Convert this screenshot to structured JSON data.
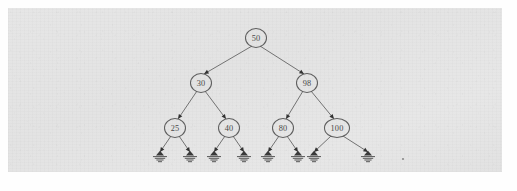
{
  "figure": {
    "background_color": "#e4e4e4",
    "page_color": "#fefefe",
    "node_stroke_color": "#5e5e5e",
    "edge_color": "#6b6b6b",
    "arrow_color": "#333333",
    "ground_color": "#3a3a3a"
  },
  "nodes": [
    {
      "id": "n50",
      "label": "50",
      "cx": 256,
      "cy": 38,
      "rx": 10.5,
      "ry": 9.5,
      "level": 0
    },
    {
      "id": "n30",
      "label": "30",
      "cx": 201,
      "cy": 83,
      "rx": 10.5,
      "ry": 9.5,
      "level": 1
    },
    {
      "id": "n98",
      "label": "98",
      "cx": 307,
      "cy": 83,
      "rx": 10.5,
      "ry": 9.5,
      "level": 1
    },
    {
      "id": "n25",
      "label": "25",
      "cx": 175,
      "cy": 128,
      "rx": 10.5,
      "ry": 9.5,
      "level": 2
    },
    {
      "id": "n40",
      "label": "40",
      "cx": 229,
      "cy": 128,
      "rx": 10.5,
      "ry": 9.5,
      "level": 2
    },
    {
      "id": "n80",
      "label": "80",
      "cx": 283,
      "cy": 128,
      "rx": 10.5,
      "ry": 9.5,
      "level": 2
    },
    {
      "id": "n100",
      "label": "100",
      "cx": 337,
      "cy": 128,
      "rx": 12.5,
      "ry": 9.5,
      "level": 2
    }
  ],
  "edges": [
    {
      "from": "n50",
      "to": "n30",
      "x1": 252,
      "y1": 46,
      "x2": 204,
      "y2": 74
    },
    {
      "from": "n50",
      "to": "n98",
      "x1": 260,
      "y1": 46,
      "x2": 304,
      "y2": 74
    },
    {
      "from": "n30",
      "to": "n25",
      "x1": 197,
      "y1": 91,
      "x2": 178,
      "y2": 119
    },
    {
      "from": "n30",
      "to": "n40",
      "x1": 205,
      "y1": 91,
      "x2": 226,
      "y2": 119
    },
    {
      "from": "n98",
      "to": "n80",
      "x1": 303,
      "y1": 91,
      "x2": 286,
      "y2": 119
    },
    {
      "from": "n98",
      "to": "n100",
      "x1": 311,
      "y1": 91,
      "x2": 334,
      "y2": 119
    },
    {
      "from": "n25",
      "to": "g1",
      "x1": 171,
      "y1": 136,
      "x2": 160,
      "y2": 152
    },
    {
      "from": "n25",
      "to": "g2",
      "x1": 179,
      "y1": 136,
      "x2": 190,
      "y2": 152
    },
    {
      "from": "n40",
      "to": "g3",
      "x1": 225,
      "y1": 136,
      "x2": 214,
      "y2": 152
    },
    {
      "from": "n40",
      "to": "g4",
      "x1": 233,
      "y1": 136,
      "x2": 244,
      "y2": 152
    },
    {
      "from": "n80",
      "to": "g5",
      "x1": 279,
      "y1": 136,
      "x2": 268,
      "y2": 152
    },
    {
      "from": "n80",
      "to": "g6",
      "x1": 287,
      "y1": 136,
      "x2": 298,
      "y2": 152
    },
    {
      "from": "n100",
      "to": "g7",
      "x1": 331,
      "y1": 136,
      "x2": 314,
      "y2": 152
    },
    {
      "from": "n100",
      "to": "g8",
      "x1": 343,
      "y1": 136,
      "x2": 368,
      "y2": 152
    }
  ],
  "null_terminators": [
    {
      "id": "g1",
      "cx": 160,
      "cy": 155,
      "parent": "n25",
      "side": "left"
    },
    {
      "id": "g2",
      "cx": 190,
      "cy": 155,
      "parent": "n25",
      "side": "right"
    },
    {
      "id": "g3",
      "cx": 214,
      "cy": 155,
      "parent": "n40",
      "side": "left"
    },
    {
      "id": "g4",
      "cx": 244,
      "cy": 155,
      "parent": "n40",
      "side": "right"
    },
    {
      "id": "g5",
      "cx": 268,
      "cy": 155,
      "parent": "n80",
      "side": "left"
    },
    {
      "id": "g6",
      "cx": 298,
      "cy": 155,
      "parent": "n80",
      "side": "right"
    },
    {
      "id": "g7",
      "cx": 314,
      "cy": 155,
      "parent": "n100",
      "side": "left"
    },
    {
      "id": "g8",
      "cx": 368,
      "cy": 155,
      "parent": "n100",
      "side": "right"
    }
  ],
  "tree_structure": {
    "root": "50",
    "levels": 3,
    "node_count": 7,
    "null_leaf_count": 8,
    "values_inorder": [
      "25",
      "30",
      "40",
      "50",
      "80",
      "98",
      "100"
    ],
    "adjacency": {
      "50": {
        "left": "30",
        "right": "98"
      },
      "30": {
        "left": "25",
        "right": "40"
      },
      "98": {
        "left": "80",
        "right": "100"
      },
      "25": {
        "left": "null",
        "right": "null"
      },
      "40": {
        "left": "null",
        "right": "null"
      },
      "80": {
        "left": "null",
        "right": "null"
      },
      "100": {
        "left": "null",
        "right": "null"
      }
    }
  },
  "artifacts": [
    {
      "id": "speck-right",
      "cx": 403,
      "cy": 159,
      "r": 1.1
    }
  ]
}
